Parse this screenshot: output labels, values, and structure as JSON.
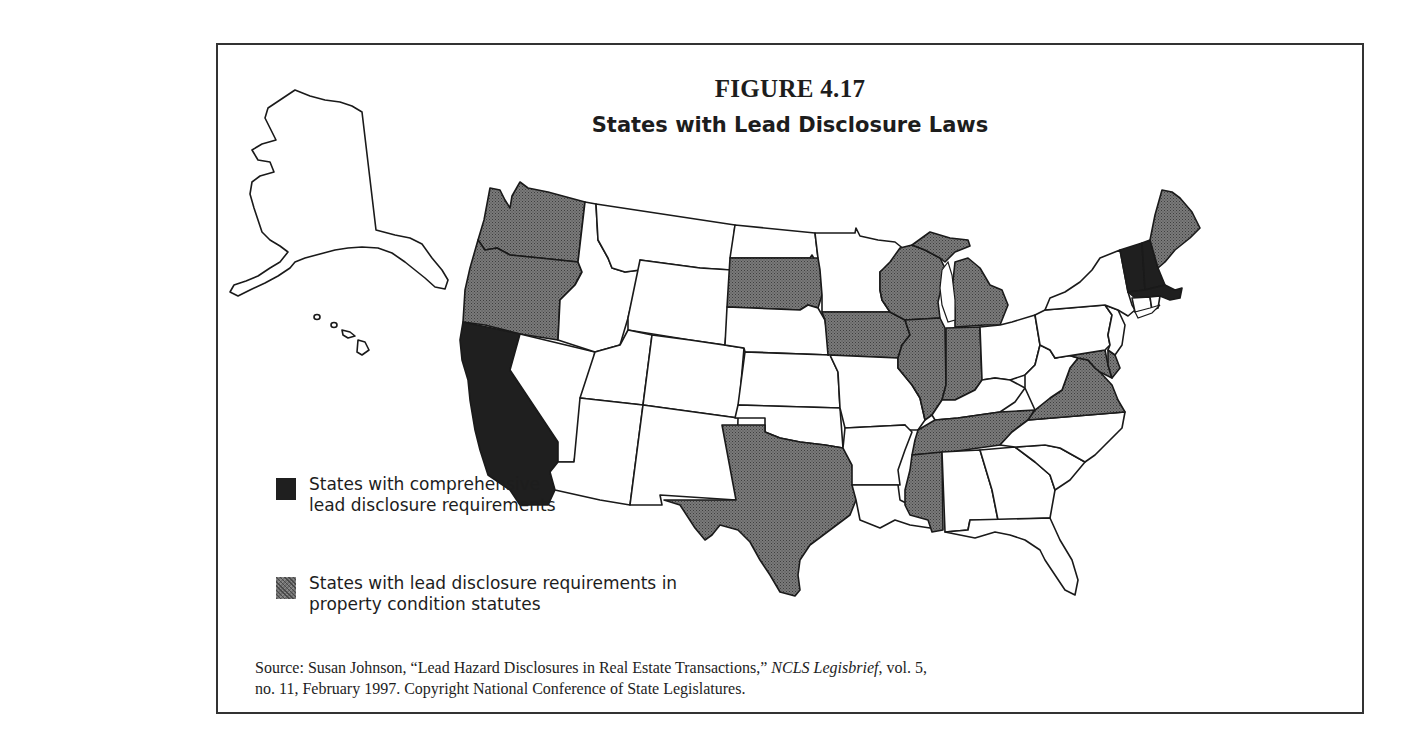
{
  "figure": {
    "number": "FIGURE 4.17",
    "title": "States with Lead Disclosure Laws"
  },
  "legend": {
    "items": [
      {
        "key": "comprehensive",
        "line1": "States with comprehensive",
        "line2": "lead disclosure requirements",
        "color": "#1f1f1f",
        "pattern": "solid"
      },
      {
        "key": "property_condition",
        "line1": "States with lead disclosure requirements in",
        "line2": "property condition statutes",
        "color": "#6f6f6f",
        "pattern": "stippled"
      }
    ]
  },
  "map": {
    "categories": {
      "comprehensive": [
        "California",
        "Vermont",
        "New Hampshire",
        "Massachusetts"
      ],
      "property_condition": [
        "Washington",
        "Oregon",
        "South Dakota",
        "Iowa",
        "Wisconsin",
        "Michigan",
        "Illinois",
        "Indiana",
        "Texas",
        "Tennessee",
        "Mississippi",
        "Virginia",
        "Maryland",
        "Delaware",
        "Maine"
      ],
      "none": [
        "Alaska",
        "Hawaii",
        "Idaho",
        "Montana",
        "Nevada",
        "Utah",
        "Arizona",
        "Wyoming",
        "Colorado",
        "New Mexico",
        "North Dakota",
        "Nebraska",
        "Kansas",
        "Oklahoma",
        "Minnesota",
        "Missouri",
        "Arkansas",
        "Louisiana",
        "Alabama",
        "Georgia",
        "Florida",
        "South Carolina",
        "North Carolina",
        "Kentucky",
        "West Virginia",
        "Ohio",
        "Pennsylvania",
        "New York",
        "New Jersey",
        "Connecticut",
        "Rhode Island"
      ]
    }
  },
  "source": {
    "prefix": "Source: Susan Johnson, “Lead Hazard Disclosures in Real Estate Transactions,” ",
    "publication": "NCLS Legisbrief",
    "suffix": ", vol. 5,",
    "line2": "no. 11, February 1997. Copyright National Conference of State Legislatures."
  }
}
